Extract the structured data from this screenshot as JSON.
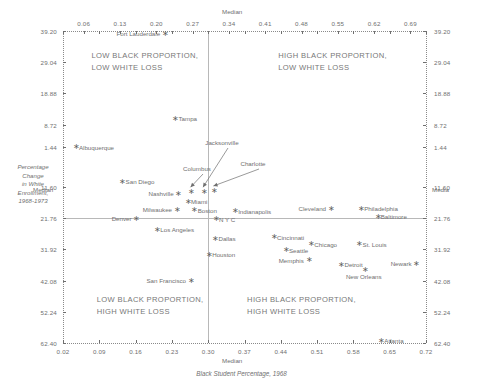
{
  "chart_data": {
    "type": "scatter",
    "title": "",
    "xlabel": "Black Student Percentage, 1968",
    "ylabel": "Percentage Change in White Enrollment, 1968-1973",
    "xlim": [
      0.02,
      0.72
    ],
    "ylim": [
      -39.2,
      62.4
    ],
    "x_ticks": [
      "0.02",
      "0.09",
      "0.16",
      "0.23",
      "0.30",
      "0.37",
      "0.44",
      "0.51",
      "0.58",
      "0.65",
      "0.72"
    ],
    "x_ticks_top": [
      "0.06",
      "0.13",
      "0.20",
      "0.27",
      "0.34",
      "0.41",
      "0.48",
      "0.55",
      "0.62",
      "0.69"
    ],
    "y_ticks": [
      "39.20",
      "29.04",
      "18.88",
      "8.72",
      "1.44",
      "11.60",
      "21.76",
      "31.92",
      "42.08",
      "52.24",
      "62.40"
    ],
    "x_median": 0.3,
    "y_median": 21.76,
    "median_label": "Median",
    "grid": false,
    "legend": "none",
    "points": [
      {
        "city": "Fort Lauderdale",
        "x": 0.215,
        "y": -38.2,
        "label_side": "left"
      },
      {
        "city": "Tampa",
        "x": 0.235,
        "y": -10.4,
        "label_side": "right"
      },
      {
        "city": "Albuquerque",
        "x": 0.043,
        "y": -1.2,
        "label_side": "right"
      },
      {
        "city": "San Diego",
        "x": 0.133,
        "y": 10.1,
        "label_side": "right"
      },
      {
        "city": "Columbus",
        "x": 0.266,
        "y": 13.3,
        "label_side": "none"
      },
      {
        "city": "Jacksonville",
        "x": 0.29,
        "y": 13.3,
        "label_side": "none"
      },
      {
        "city": "Charlotte",
        "x": 0.31,
        "y": 12.9,
        "label_side": "none"
      },
      {
        "city": "Nashville",
        "x": 0.241,
        "y": 13.9,
        "label_side": "left"
      },
      {
        "city": "Miami",
        "x": 0.259,
        "y": 16.5,
        "label_side": "right"
      },
      {
        "city": "Milwaukee",
        "x": 0.238,
        "y": 19.2,
        "label_side": "left"
      },
      {
        "city": "Boston",
        "x": 0.272,
        "y": 19.3,
        "label_side": "right"
      },
      {
        "city": "Indianapolis",
        "x": 0.35,
        "y": 19.6,
        "label_side": "right"
      },
      {
        "city": "Cleveland",
        "x": 0.535,
        "y": 18.8,
        "label_side": "left"
      },
      {
        "city": "Philadelphia",
        "x": 0.593,
        "y": 18.8,
        "label_side": "right"
      },
      {
        "city": "N Y C",
        "x": 0.313,
        "y": 22.3,
        "label_side": "right"
      },
      {
        "city": "Baltimore",
        "x": 0.625,
        "y": 21.4,
        "label_side": "right"
      },
      {
        "city": "Denver",
        "x": 0.16,
        "y": 22.1,
        "label_side": "left"
      },
      {
        "city": "Los Angeles",
        "x": 0.2,
        "y": 25.6,
        "label_side": "right"
      },
      {
        "city": "Dallas",
        "x": 0.312,
        "y": 28.6,
        "label_side": "right"
      },
      {
        "city": "Cincinnati",
        "x": 0.425,
        "y": 28.1,
        "label_side": "right"
      },
      {
        "city": "Chicago",
        "x": 0.497,
        "y": 30.4,
        "label_side": "right"
      },
      {
        "city": "St. Louis",
        "x": 0.59,
        "y": 30.4,
        "label_side": "right"
      },
      {
        "city": "Seattle",
        "x": 0.448,
        "y": 32.3,
        "label_side": "right"
      },
      {
        "city": "Houston",
        "x": 0.3,
        "y": 33.8,
        "label_side": "right"
      },
      {
        "city": "Memphis",
        "x": 0.492,
        "y": 35.6,
        "label_side": "left"
      },
      {
        "city": "Detroit",
        "x": 0.555,
        "y": 37.1,
        "label_side": "right"
      },
      {
        "city": "Newark",
        "x": 0.7,
        "y": 36.8,
        "label_side": "left"
      },
      {
        "city": "New Orleans",
        "x": 0.6,
        "y": 38.7,
        "label_side": "below"
      },
      {
        "city": "San Francisco",
        "x": 0.265,
        "y": 42.2,
        "label_side": "left"
      },
      {
        "city": "Atlanta",
        "x": 0.632,
        "y": 61.9,
        "label_side": "right"
      }
    ],
    "annotations": [
      {
        "text": "Columbus",
        "target": "Columbus"
      },
      {
        "text": "Jacksonville",
        "target": "Jacksonville"
      },
      {
        "text": "Charlotte",
        "target": "Charlotte"
      }
    ],
    "quadrant_labels": [
      {
        "id": "top-left",
        "line1": "LOW BLACK PROPORTION,",
        "line2": "LOW WHITE LOSS"
      },
      {
        "id": "top-right",
        "line1": "HIGH BLACK PROPORTION,",
        "line2": "LOW WHITE LOSS"
      },
      {
        "id": "bottom-left",
        "line1": "LOW BLACK PROPORTION,",
        "line2": "HIGH WHITE LOSS"
      },
      {
        "id": "bottom-right",
        "line1": "HIGH BLACK PROPORTION,",
        "line2": "HIGH WHITE LOSS"
      }
    ]
  },
  "axis_titles": {
    "x": "Black Student Percentage, 1968",
    "y_l1": "Percentage",
    "y_l2": "Change",
    "y_l3": "in White",
    "y_l4": "Enrollment,",
    "y_l5": "1968-1973"
  },
  "median_words": {
    "top": "Median",
    "bottom": "Median",
    "left": "Median",
    "right": "Media"
  }
}
